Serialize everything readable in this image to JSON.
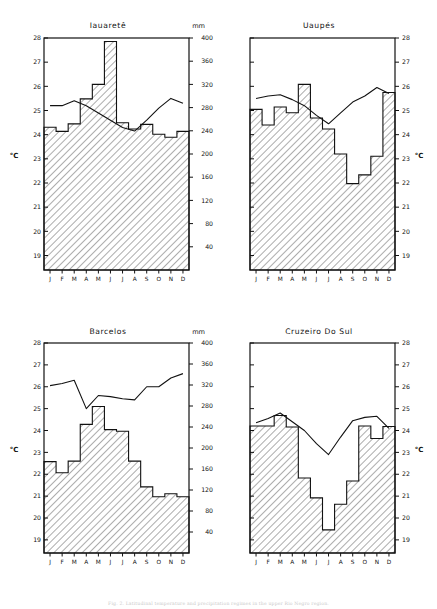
{
  "figure": {
    "caption": "Fig. 2. Latitudinal temperature and precipitation regimes in the upper Rio Negro region.",
    "left_axis_unit": "°C",
    "right_axis_unit": "°C",
    "precip_unit": "mm",
    "months": [
      "J",
      "F",
      "M",
      "A",
      "M",
      "J",
      "J",
      "A",
      "S",
      "O",
      "N",
      "D"
    ],
    "temp_ticks": [
      19,
      20,
      21,
      22,
      23,
      24,
      25,
      26,
      27,
      28
    ],
    "precip_ticks": [
      40,
      80,
      120,
      160,
      200,
      240,
      280,
      320,
      360,
      400
    ],
    "temp_range": [
      18.4,
      28
    ],
    "precip_range": [
      0,
      400
    ],
    "line_color": "#111111",
    "bar_edge_color": "#111111",
    "hatch_color": "#111111",
    "background_color": "#ffffff"
  },
  "chart_data": [
    {
      "type": "bar",
      "title": "Iauaretê",
      "xlabel": "",
      "ylabel": "°C",
      "y2label": "mm",
      "categories": [
        "J",
        "F",
        "M",
        "A",
        "M",
        "J",
        "J",
        "A",
        "S",
        "O",
        "N",
        "D"
      ],
      "series": [
        {
          "name": "Precipitation",
          "unit": "mm",
          "kind": "bar",
          "values": [
            246,
            239,
            252,
            295,
            320,
            394,
            254,
            243,
            251,
            234,
            229,
            239
          ]
        },
        {
          "name": "Temperature",
          "unit": "°C",
          "kind": "line",
          "values": [
            25.2,
            25.2,
            25.4,
            25.2,
            24.9,
            24.6,
            24.3,
            24.15,
            24.6,
            25.1,
            25.5,
            25.3
          ]
        }
      ],
      "ylim": [
        18.4,
        28
      ],
      "y2lim": [
        0,
        400
      ],
      "grid": false,
      "legend": "none"
    },
    {
      "type": "bar",
      "title": "Uaupés",
      "xlabel": "",
      "ylabel": "mm",
      "y2label": "°C",
      "categories": [
        "J",
        "F",
        "M",
        "A",
        "M",
        "J",
        "J",
        "A",
        "S",
        "O",
        "N",
        "D"
      ],
      "series": [
        {
          "name": "Precipitation",
          "unit": "mm",
          "kind": "bar",
          "values": [
            277,
            250,
            281,
            271,
            320,
            262,
            243,
            200,
            149,
            164,
            196,
            306
          ]
        },
        {
          "name": "Temperature",
          "unit": "°C",
          "kind": "line",
          "values": [
            25.5,
            25.6,
            25.65,
            25.45,
            25.2,
            24.8,
            24.45,
            24.9,
            25.35,
            25.6,
            25.95,
            25.7
          ]
        }
      ],
      "ylim": [
        18.4,
        28
      ],
      "y2lim": [
        0,
        400
      ],
      "grid": false,
      "legend": "none"
    },
    {
      "type": "bar",
      "title": "Barcelos",
      "xlabel": "",
      "ylabel": "°C",
      "y2label": "mm",
      "categories": [
        "J",
        "F",
        "M",
        "A",
        "M",
        "J",
        "J",
        "A",
        "S",
        "O",
        "N",
        "D"
      ],
      "series": [
        {
          "name": "Precipitation",
          "unit": "mm",
          "kind": "bar",
          "values": [
            174,
            153,
            175,
            245,
            279,
            235,
            232,
            175,
            126,
            107,
            113,
            107
          ]
        },
        {
          "name": "Temperature",
          "unit": "°C",
          "kind": "line",
          "values": [
            26.05,
            26.15,
            26.3,
            25.0,
            25.6,
            25.55,
            25.45,
            25.4,
            26.0,
            26.0,
            26.4,
            26.6
          ]
        }
      ],
      "ylim": [
        18.4,
        28
      ],
      "y2lim": [
        0,
        400
      ],
      "grid": false,
      "legend": "none"
    },
    {
      "type": "bar",
      "title": "Cruzeiro Do Sul",
      "xlabel": "",
      "ylabel": "mm",
      "y2label": "°C",
      "categories": [
        "J",
        "F",
        "M",
        "A",
        "M",
        "J",
        "J",
        "A",
        "S",
        "O",
        "N",
        "D"
      ],
      "series": [
        {
          "name": "Precipitation",
          "unit": "mm",
          "kind": "bar",
          "values": [
            242,
            242,
            262,
            240,
            143,
            105,
            44,
            93,
            137,
            242,
            218,
            241
          ]
        },
        {
          "name": "Temperature",
          "unit": "°C",
          "kind": "line",
          "values": [
            24.35,
            24.55,
            24.8,
            24.4,
            24.0,
            23.4,
            22.9,
            23.7,
            24.45,
            24.6,
            24.65,
            24.1
          ]
        }
      ],
      "ylim": [
        18.4,
        28
      ],
      "y2lim": [
        0,
        400
      ],
      "grid": false,
      "legend": "none"
    }
  ]
}
